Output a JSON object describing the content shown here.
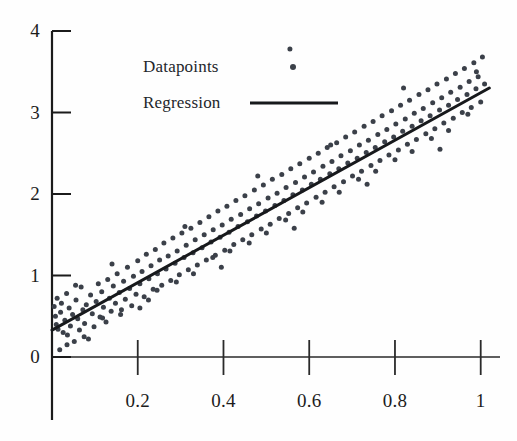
{
  "chart_data": {
    "type": "scatter",
    "title": "",
    "xlabel": "",
    "ylabel": "",
    "xlim": [
      0,
      1.045
    ],
    "ylim": [
      0,
      4
    ],
    "grid": false,
    "xticks": [
      0.2,
      0.4,
      0.6,
      0.8,
      1
    ],
    "xtick_labels": [
      "0.2",
      "0.4",
      "0.6",
      "0.8",
      "1"
    ],
    "yticks": [
      0,
      1,
      2,
      3,
      4
    ],
    "ytick_labels": [
      "0",
      "1",
      "2",
      "3",
      "4"
    ],
    "legend": {
      "position": "upper-left-inside",
      "entries": [
        {
          "label": "Datapoints",
          "marker": "dot",
          "color": "#3b4049"
        },
        {
          "label": "Regression",
          "marker": "line",
          "color": "#17191c"
        }
      ]
    },
    "series": [
      {
        "name": "Datapoints",
        "type": "scatter",
        "color": "#3b4049",
        "marker_size": 5,
        "points": [
          [
            0.005,
            0.62
          ],
          [
            0.008,
            0.5
          ],
          [
            0.01,
            0.4
          ],
          [
            0.012,
            0.72
          ],
          [
            0.014,
            0.34
          ],
          [
            0.018,
            0.09
          ],
          [
            0.02,
            0.55
          ],
          [
            0.022,
            0.66
          ],
          [
            0.026,
            0.3
          ],
          [
            0.03,
            0.45
          ],
          [
            0.034,
            0.78
          ],
          [
            0.036,
            0.27
          ],
          [
            0.04,
            0.6
          ],
          [
            0.043,
            0.38
          ],
          [
            0.048,
            0.52
          ],
          [
            0.052,
            0.19
          ],
          [
            0.056,
            0.7
          ],
          [
            0.06,
            0.47
          ],
          [
            0.064,
            0.33
          ],
          [
            0.068,
            0.86
          ],
          [
            0.072,
            0.58
          ],
          [
            0.076,
            0.41
          ],
          [
            0.08,
            0.64
          ],
          [
            0.085,
            0.22
          ],
          [
            0.09,
            0.76
          ],
          [
            0.094,
            0.53
          ],
          [
            0.098,
            0.37
          ],
          [
            0.103,
            0.68
          ],
          [
            0.108,
            0.9
          ],
          [
            0.112,
            0.49
          ],
          [
            0.116,
            0.8
          ],
          [
            0.12,
            0.61
          ],
          [
            0.126,
            0.43
          ],
          [
            0.13,
            0.95
          ],
          [
            0.134,
            0.72
          ],
          [
            0.138,
            0.56
          ],
          [
            0.143,
            0.87
          ],
          [
            0.148,
            0.66
          ],
          [
            0.152,
            1.02
          ],
          [
            0.157,
            0.79
          ],
          [
            0.162,
            0.58
          ],
          [
            0.167,
            0.93
          ],
          [
            0.171,
            0.71
          ],
          [
            0.176,
            1.1
          ],
          [
            0.181,
            0.84
          ],
          [
            0.186,
            0.63
          ],
          [
            0.19,
            0.99
          ],
          [
            0.196,
            0.77
          ],
          [
            0.2,
            1.18
          ],
          [
            0.205,
            0.9
          ],
          [
            0.21,
            1.05
          ],
          [
            0.215,
            0.74
          ],
          [
            0.22,
            1.26
          ],
          [
            0.226,
            0.96
          ],
          [
            0.231,
            1.12
          ],
          [
            0.236,
            0.83
          ],
          [
            0.241,
            1.32
          ],
          [
            0.246,
            1.02
          ],
          [
            0.251,
            1.19
          ],
          [
            0.256,
            0.88
          ],
          [
            0.261,
            1.4
          ],
          [
            0.266,
            1.08
          ],
          [
            0.271,
            1.24
          ],
          [
            0.277,
            0.94
          ],
          [
            0.282,
            1.46
          ],
          [
            0.287,
            1.15
          ],
          [
            0.292,
            1.3
          ],
          [
            0.297,
            1.01
          ],
          [
            0.303,
            1.52
          ],
          [
            0.308,
            1.22
          ],
          [
            0.313,
            1.37
          ],
          [
            0.318,
            1.07
          ],
          [
            0.324,
            1.58
          ],
          [
            0.329,
            1.28
          ],
          [
            0.334,
            1.44
          ],
          [
            0.339,
            1.13
          ],
          [
            0.345,
            1.65
          ],
          [
            0.35,
            1.34
          ],
          [
            0.355,
            1.5
          ],
          [
            0.36,
            1.19
          ],
          [
            0.366,
            1.72
          ],
          [
            0.371,
            1.41
          ],
          [
            0.376,
            1.56
          ],
          [
            0.381,
            1.25
          ],
          [
            0.387,
            1.79
          ],
          [
            0.392,
            1.47
          ],
          [
            0.397,
            1.62
          ],
          [
            0.403,
            1.31
          ],
          [
            0.408,
            1.85
          ],
          [
            0.413,
            1.53
          ],
          [
            0.418,
            1.69
          ],
          [
            0.424,
            1.38
          ],
          [
            0.429,
            1.92
          ],
          [
            0.434,
            1.6
          ],
          [
            0.44,
            1.75
          ],
          [
            0.445,
            1.44
          ],
          [
            0.45,
            1.98
          ],
          [
            0.456,
            1.66
          ],
          [
            0.461,
            1.82
          ],
          [
            0.466,
            1.5
          ],
          [
            0.472,
            2.05
          ],
          [
            0.477,
            1.73
          ],
          [
            0.482,
            1.88
          ],
          [
            0.488,
            1.57
          ],
          [
            0.493,
            2.11
          ],
          [
            0.498,
            1.79
          ],
          [
            0.504,
            1.95
          ],
          [
            0.509,
            1.63
          ],
          [
            0.514,
            2.18
          ],
          [
            0.52,
            1.86
          ],
          [
            0.525,
            2.01
          ],
          [
            0.53,
            1.7
          ],
          [
            0.536,
            2.24
          ],
          [
            0.541,
            1.92
          ],
          [
            0.546,
            2.08
          ],
          [
            0.552,
            1.76
          ],
          [
            0.557,
            2.31
          ],
          [
            0.562,
            1.99
          ],
          [
            0.568,
            2.14
          ],
          [
            0.573,
            1.83
          ],
          [
            0.578,
            2.37
          ],
          [
            0.584,
            2.05
          ],
          [
            0.589,
            2.21
          ],
          [
            0.594,
            1.89
          ],
          [
            0.6,
            2.44
          ],
          [
            0.605,
            2.12
          ],
          [
            0.61,
            2.27
          ],
          [
            0.616,
            1.96
          ],
          [
            0.621,
            2.5
          ],
          [
            0.626,
            2.18
          ],
          [
            0.632,
            2.34
          ],
          [
            0.637,
            2.02
          ],
          [
            0.642,
            2.57
          ],
          [
            0.648,
            2.25
          ],
          [
            0.653,
            2.4
          ],
          [
            0.658,
            2.09
          ],
          [
            0.664,
            2.63
          ],
          [
            0.669,
            2.31
          ],
          [
            0.674,
            2.47
          ],
          [
            0.68,
            2.15
          ],
          [
            0.685,
            2.7
          ],
          [
            0.69,
            2.38
          ],
          [
            0.696,
            2.53
          ],
          [
            0.701,
            2.22
          ],
          [
            0.706,
            2.76
          ],
          [
            0.712,
            2.44
          ],
          [
            0.717,
            2.6
          ],
          [
            0.722,
            2.28
          ],
          [
            0.728,
            2.83
          ],
          [
            0.733,
            2.51
          ],
          [
            0.738,
            2.66
          ],
          [
            0.744,
            2.35
          ],
          [
            0.749,
            2.89
          ],
          [
            0.754,
            2.57
          ],
          [
            0.76,
            2.73
          ],
          [
            0.765,
            2.41
          ],
          [
            0.77,
            2.96
          ],
          [
            0.776,
            2.64
          ],
          [
            0.781,
            2.79
          ],
          [
            0.786,
            2.48
          ],
          [
            0.792,
            3.02
          ],
          [
            0.797,
            2.7
          ],
          [
            0.802,
            2.86
          ],
          [
            0.808,
            2.54
          ],
          [
            0.813,
            3.09
          ],
          [
            0.818,
            2.77
          ],
          [
            0.824,
            2.92
          ],
          [
            0.829,
            2.61
          ],
          [
            0.834,
            3.15
          ],
          [
            0.84,
            2.83
          ],
          [
            0.845,
            2.99
          ],
          [
            0.85,
            2.67
          ],
          [
            0.856,
            3.22
          ],
          [
            0.861,
            2.9
          ],
          [
            0.866,
            3.05
          ],
          [
            0.872,
            2.74
          ],
          [
            0.877,
            3.28
          ],
          [
            0.882,
            2.96
          ],
          [
            0.888,
            3.12
          ],
          [
            0.893,
            2.8
          ],
          [
            0.898,
            3.35
          ],
          [
            0.904,
            3.03
          ],
          [
            0.909,
            3.18
          ],
          [
            0.914,
            2.87
          ],
          [
            0.92,
            3.41
          ],
          [
            0.925,
            3.09
          ],
          [
            0.93,
            3.25
          ],
          [
            0.936,
            2.93
          ],
          [
            0.941,
            3.48
          ],
          [
            0.946,
            3.16
          ],
          [
            0.952,
            3.31
          ],
          [
            0.957,
            3.0
          ],
          [
            0.962,
            3.54
          ],
          [
            0.968,
            3.22
          ],
          [
            0.973,
            3.38
          ],
          [
            0.978,
            3.06
          ],
          [
            0.984,
            3.61
          ],
          [
            0.989,
            3.29
          ],
          [
            0.994,
            3.44
          ],
          [
            1.0,
            3.13
          ],
          [
            1.004,
            3.68
          ],
          [
            1.009,
            3.35
          ],
          [
            0.075,
            0.25
          ],
          [
            0.16,
            0.52
          ],
          [
            0.245,
            0.82
          ],
          [
            0.33,
            1.02
          ],
          [
            0.415,
            1.3
          ],
          [
            0.5,
            1.52
          ],
          [
            0.585,
            1.78
          ],
          [
            0.67,
            2.02
          ],
          [
            0.755,
            2.28
          ],
          [
            0.84,
            2.52
          ],
          [
            0.925,
            2.78
          ],
          [
            0.055,
            0.88
          ],
          [
            0.14,
            1.14
          ],
          [
            0.225,
            0.7
          ],
          [
            0.31,
            1.6
          ],
          [
            0.395,
            1.1
          ],
          [
            0.48,
            2.22
          ],
          [
            0.565,
            1.58
          ],
          [
            0.65,
            2.6
          ],
          [
            0.735,
            2.12
          ],
          [
            0.82,
            3.3
          ],
          [
            0.905,
            2.55
          ],
          [
            0.99,
            3.5
          ],
          [
            0.035,
            0.15
          ],
          [
            0.118,
            0.48
          ],
          [
            0.205,
            0.6
          ],
          [
            0.29,
            0.92
          ],
          [
            0.375,
            1.22
          ],
          [
            0.46,
            1.4
          ],
          [
            0.545,
            1.68
          ],
          [
            0.63,
            1.9
          ],
          [
            0.715,
            2.18
          ],
          [
            0.8,
            2.42
          ],
          [
            0.885,
            2.68
          ],
          [
            0.97,
            2.98
          ],
          [
            0.555,
            3.78
          ]
        ]
      },
      {
        "name": "Regression",
        "type": "line",
        "color": "#17191c",
        "line_width": 3,
        "slope": 3.0,
        "intercept": 0.33,
        "endpoints": [
          [
            0.0,
            0.33
          ],
          [
            1.02,
            3.3
          ]
        ]
      }
    ]
  }
}
